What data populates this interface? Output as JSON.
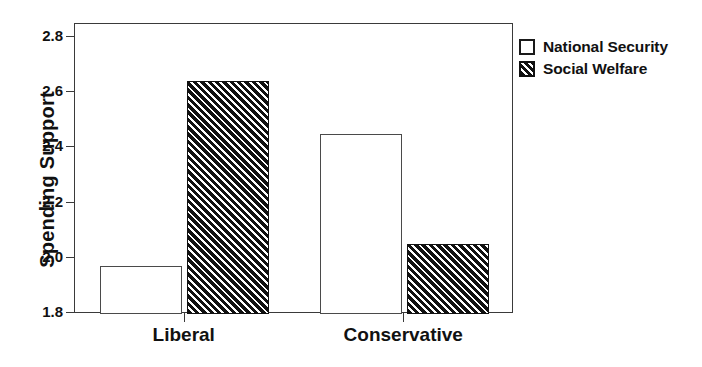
{
  "chart_data": {
    "type": "bar",
    "title": "",
    "subtitle": "",
    "xlabel": "",
    "ylabel": "Spending Support",
    "categories": [
      "Liberal",
      "Conservative"
    ],
    "series": [
      {
        "name": "National Security",
        "style": "open",
        "values": [
          1.975,
          2.45
        ]
      },
      {
        "name": "Social Welfare",
        "style": "hatched",
        "values": [
          2.645,
          2.055
        ]
      }
    ],
    "ylim": [
      1.8,
      2.85
    ],
    "yticks": [
      1.8,
      2.0,
      2.2,
      2.4,
      2.6,
      2.8
    ],
    "ytick_labels": [
      "1.8",
      "2.0",
      "2.2",
      "2.4",
      "2.6",
      "2.8"
    ],
    "xtick_labels": [
      "Liberal",
      "Conservative"
    ],
    "grid": false,
    "legend_position": "outside-right-top",
    "legend_entries": [
      "National Security",
      "Social Welfare"
    ],
    "colors": {
      "axis": "#3a3a3a",
      "text": "#111111",
      "bar_open_fill": "#ffffff",
      "bar_open_edge": "#4a4a4a",
      "bar_hatch_line": "#111111",
      "background": "#ffffff"
    }
  },
  "axis": {
    "y_title": "Spending Support",
    "y_ticks": [
      {
        "label": "2.8",
        "value": 2.8
      },
      {
        "label": "2.6",
        "value": 2.6
      },
      {
        "label": "2.4",
        "value": 2.4
      },
      {
        "label": "2.2",
        "value": 2.2
      },
      {
        "label": "2.0",
        "value": 2.0
      },
      {
        "label": "1.8",
        "value": 1.8
      }
    ],
    "x_categories": [
      {
        "label": "Liberal"
      },
      {
        "label": "Conservative"
      }
    ]
  },
  "legend": {
    "items": [
      {
        "label": "National Security",
        "style": "open"
      },
      {
        "label": "Social Welfare",
        "style": "hatched"
      }
    ]
  }
}
